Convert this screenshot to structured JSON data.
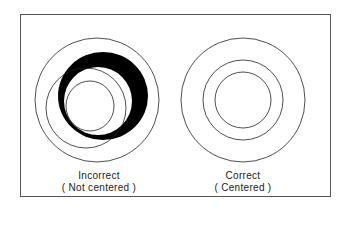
{
  "diagram": {
    "left": {
      "title": "Incorrect",
      "subtitle": "( Not centered )"
    },
    "right": {
      "title": "Correct",
      "subtitle": "( Centered )"
    },
    "colors": {
      "stroke": "#222222",
      "fill": "#000000",
      "frame": "#555555"
    }
  }
}
